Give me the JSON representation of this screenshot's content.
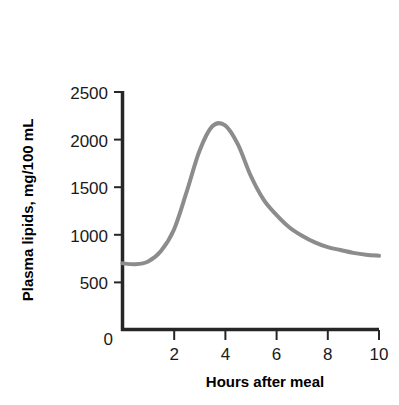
{
  "chart_data": {
    "type": "line",
    "title": "",
    "xlabel": "Hours after meal",
    "ylabel": "Plasma lipids, mg/100 mL",
    "xlim": [
      0,
      10
    ],
    "ylim": [
      0,
      2500
    ],
    "xticks": [
      0,
      2,
      4,
      6,
      8,
      10
    ],
    "xtick_labels": [
      "0",
      "2",
      "4",
      "6",
      "8",
      "10"
    ],
    "yticks": [
      0,
      500,
      1000,
      1500,
      2000,
      2500
    ],
    "ytick_labels": [
      "0",
      "500",
      "1000",
      "1500",
      "2000",
      "2500"
    ],
    "grid": false,
    "legend": null,
    "series": [
      {
        "name": "Plasma lipids",
        "color": "#8c8c8c",
        "linewidth": 4,
        "x": [
          0.0,
          0.5,
          1.0,
          1.5,
          2.0,
          2.5,
          3.0,
          3.5,
          4.0,
          4.5,
          5.0,
          5.5,
          6.0,
          6.5,
          7.0,
          7.5,
          8.0,
          8.5,
          9.0,
          9.5,
          10.0
        ],
        "values": [
          700,
          690,
          720,
          830,
          1050,
          1450,
          1880,
          2140,
          2150,
          1950,
          1620,
          1370,
          1210,
          1080,
          990,
          920,
          870,
          840,
          810,
          790,
          780
        ]
      }
    ],
    "annotations": []
  },
  "axes": {
    "x_axis_label": "Hours after meal",
    "y_axis_label": "Plasma lipids, mg/100 mL",
    "x_tick_0": "0",
    "x_tick_2": "2",
    "x_tick_4": "4",
    "x_tick_6": "6",
    "x_tick_8": "8",
    "x_tick_10": "10",
    "y_tick_0": "0",
    "y_tick_500": "500",
    "y_tick_1000": "1000",
    "y_tick_1500": "1500",
    "y_tick_2000": "2000",
    "y_tick_2500": "2500"
  },
  "colors": {
    "curve": "#8c8c8c",
    "axis": "#262626",
    "text": "#000000",
    "background": "#ffffff"
  }
}
